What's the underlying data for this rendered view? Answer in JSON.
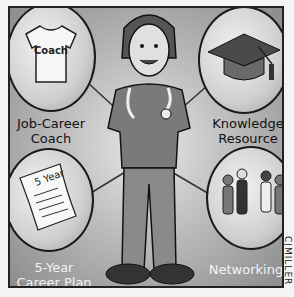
{
  "illustration": {
    "description": "Cartoon of a doctor in scrubs with stethoscope surrounded by four career-support bubbles",
    "center_figure": "doctor-with-stethoscope",
    "bubbles": [
      {
        "position": "top-left",
        "icon": "t-shirt-icon",
        "icon_text": "Coach",
        "label": "Job-Career Coach"
      },
      {
        "position": "top-right",
        "icon": "graduation-cap-icon",
        "label": "Knowledge Resource"
      },
      {
        "position": "bottom-left",
        "icon": "document-icon",
        "icon_text": "5 Year",
        "label": "5-Year Career Plan"
      },
      {
        "position": "bottom-right",
        "icon": "people-group-icon",
        "label": "Networking"
      }
    ],
    "signature": "CJMILLER"
  }
}
